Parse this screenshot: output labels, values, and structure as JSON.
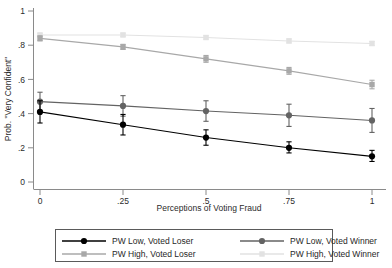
{
  "chart_data": {
    "type": "line",
    "title": "",
    "xlabel": "Perceptions of Voting Fraud",
    "ylabel": "Prob. \"Very Confident\"",
    "x": [
      0,
      0.25,
      0.5,
      0.75,
      1
    ],
    "xtick_labels": [
      "0",
      ".25",
      ".5",
      ".75",
      "1"
    ],
    "ytick_labels": [
      "0",
      ".2",
      ".4",
      ".6",
      ".8",
      "1"
    ],
    "yticks": [
      0,
      0.2,
      0.4,
      0.6,
      0.8,
      1
    ],
    "xlim": [
      0,
      1
    ],
    "ylim": [
      0,
      1
    ],
    "grid": false,
    "legend_position": "below-axes",
    "error_bars": "95% confidence interval",
    "series": [
      {
        "name": "PW Low, Voted Loser",
        "color": "#000000",
        "marker": "circle",
        "values": [
          0.41,
          0.335,
          0.26,
          0.2,
          0.15
        ],
        "err_low": [
          0.345,
          0.275,
          0.215,
          0.17,
          0.12
        ],
        "err_high": [
          0.475,
          0.395,
          0.305,
          0.235,
          0.185
        ]
      },
      {
        "name": "PW Low, Voted Winner",
        "color": "#636363",
        "marker": "circle",
        "values": [
          0.47,
          0.445,
          0.415,
          0.39,
          0.36
        ],
        "err_low": [
          0.415,
          0.385,
          0.355,
          0.325,
          0.29
        ],
        "err_high": [
          0.525,
          0.505,
          0.475,
          0.455,
          0.43
        ]
      },
      {
        "name": "PW High, Voted Loser",
        "color": "#a8a8a8",
        "marker": "square",
        "values": [
          0.84,
          0.79,
          0.72,
          0.65,
          0.57
        ],
        "err_low": [
          0.825,
          0.775,
          0.7,
          0.63,
          0.545
        ],
        "err_high": [
          0.855,
          0.805,
          0.74,
          0.67,
          0.595
        ]
      },
      {
        "name": "PW High, Voted Winner",
        "color": "#e2e2e2",
        "marker": "square",
        "values": [
          0.86,
          0.86,
          0.845,
          0.825,
          0.81
        ],
        "err_low": [
          0.85,
          0.85,
          0.835,
          0.813,
          0.798
        ],
        "err_high": [
          0.87,
          0.87,
          0.855,
          0.837,
          0.822
        ]
      }
    ]
  },
  "legend": {
    "entries": [
      {
        "label": "PW Low, Voted Loser",
        "color": "#000000"
      },
      {
        "label": "PW Low, Voted Winner",
        "color": "#636363"
      },
      {
        "label": "PW High, Voted Loser",
        "color": "#a8a8a8"
      },
      {
        "label": "PW High, Voted Winner",
        "color": "#e2e2e2"
      }
    ]
  }
}
